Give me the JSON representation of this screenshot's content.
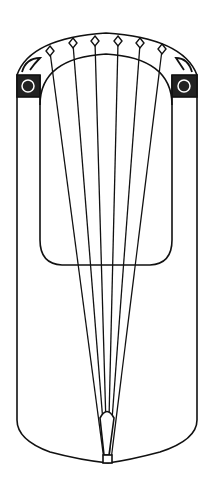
{
  "figure": {
    "stroke_color": "#111111",
    "background": "#ffffff",
    "string_count": 6,
    "tuning_pegs": 6
  }
}
